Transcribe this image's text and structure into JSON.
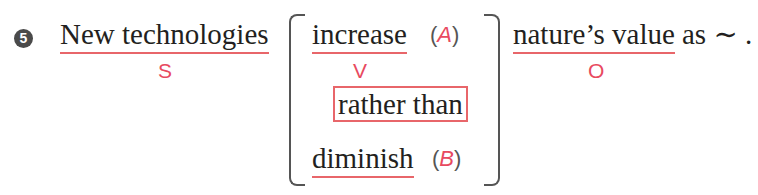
{
  "item_number": "5",
  "subject": {
    "text": "New technologies",
    "role": "S"
  },
  "verb_choice": {
    "option_a": {
      "text": "increase",
      "label": "A",
      "role": "V"
    },
    "connector": "rather than",
    "option_b": {
      "text": "diminish",
      "label": "B"
    }
  },
  "object": {
    "text": "nature’s value",
    "role": "O"
  },
  "tail": "as ∼ ."
}
